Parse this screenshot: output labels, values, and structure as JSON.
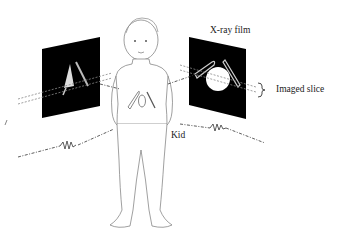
{
  "diagram": {
    "type": "xray-imaging-illustration",
    "labels": {
      "film": "X-ray film",
      "slice": "Imaged slice",
      "subject": "Kid"
    },
    "elements": {
      "left_film": "left-xray-film-panel",
      "right_film": "right-xray-film-panel",
      "subject": "child-figure",
      "objects_in_body": [
        "safety-pin",
        "coin",
        "pencil"
      ],
      "beams": [
        "x-ray-beam-upper",
        "x-ray-beam-lower"
      ]
    },
    "colors": {
      "film": "#000000",
      "line": "#333333",
      "background": "#ffffff"
    }
  }
}
